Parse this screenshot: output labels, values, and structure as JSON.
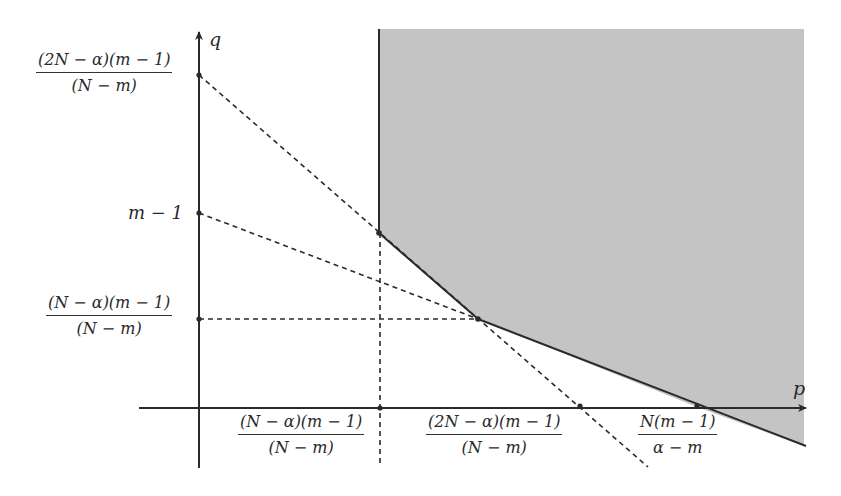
{
  "diagram": {
    "type": "region-plot",
    "axes": {
      "x_label": "p",
      "y_label": "q"
    },
    "shaded_region": {
      "description": "Feasible region bounded by vertical line, two solid segments, and extending right/up",
      "fill_color": "#c4c4c4"
    },
    "y_ticks": [
      {
        "id": "y1",
        "numerator": "(2N − α)(m − 1)",
        "denominator": "(N − m)"
      },
      {
        "id": "y2",
        "label": "m − 1"
      },
      {
        "id": "y3",
        "numerator": "(N − α)(m − 1)",
        "denominator": "(N − m)"
      }
    ],
    "x_ticks": [
      {
        "id": "x1",
        "numerator": "(N − α)(m − 1)",
        "denominator": "(N − m)"
      },
      {
        "id": "x2",
        "numerator": "(2N − α)(m − 1)",
        "denominator": "(N − m)"
      },
      {
        "id": "x3",
        "numerator": "N(m − 1)",
        "denominator": "α − m"
      }
    ],
    "lines": [
      {
        "style": "dashed",
        "from": "y1 on q-axis",
        "to": "x2 on p-axis (extended)"
      },
      {
        "style": "dashed",
        "from": "y2 on q-axis",
        "to": "x3 on p-axis via vertex B"
      },
      {
        "style": "dashed",
        "from": "y3 on q-axis",
        "to": "vertex B (horizontal)"
      },
      {
        "style": "dashed",
        "from": "x1 on p-axis",
        "to": "vertex A (vertical)"
      },
      {
        "style": "solid",
        "from": "vertex A",
        "to": "vertex B"
      },
      {
        "style": "solid",
        "from": "vertex B",
        "to": "x3 and beyond"
      }
    ],
    "colors": {
      "ink": "#2a2a2a",
      "shade": "#c4c4c4"
    }
  }
}
